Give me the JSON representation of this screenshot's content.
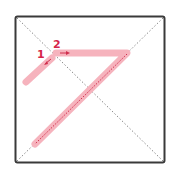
{
  "diagram": {
    "type": "stroke-order",
    "character": "ク",
    "colors": {
      "frame": "#3a3a3a",
      "guides": "#8a8a8a",
      "stroke_fill": "#f6b3bd",
      "stroke_center": "#d0304f",
      "label": "#d6254a"
    },
    "strokes": [
      {
        "number": "1",
        "label": "1",
        "direction": "down-left"
      },
      {
        "number": "2",
        "label": "2",
        "direction": "right-then-down-left"
      }
    ]
  }
}
